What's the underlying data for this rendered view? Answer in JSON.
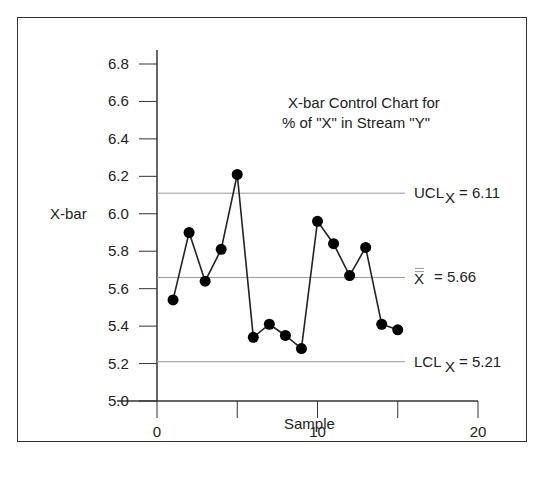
{
  "chart_data": {
    "type": "line",
    "title": "X-bar Control Chart for % of \"X\" in Stream \"Y\"",
    "title_lines": [
      "X-bar Control Chart for",
      "% of \"X\" in Stream \"Y\""
    ],
    "xlabel": "Sample",
    "ylabel": "X-bar",
    "xlim": [
      0,
      20
    ],
    "ylim": [
      5.0,
      6.8
    ],
    "x_ticks": [
      0,
      5,
      10,
      15,
      20
    ],
    "x_tick_labels": [
      "0",
      "",
      "10",
      "",
      "20"
    ],
    "y_ticks": [
      5.0,
      5.2,
      5.4,
      5.6,
      5.8,
      6.0,
      6.2,
      6.4,
      6.6,
      6.8
    ],
    "y_tick_labels": [
      "5.0",
      "5.2",
      "5.4",
      "5.6",
      "5.8",
      "6.0",
      "6.2",
      "6.4",
      "6.6",
      "6.8"
    ],
    "grid": false,
    "series": [
      {
        "name": "X-bar",
        "x": [
          1,
          2,
          3,
          4,
          5,
          6,
          7,
          8,
          9,
          10,
          11,
          12,
          13,
          14,
          15
        ],
        "values": [
          5.54,
          5.9,
          5.64,
          5.81,
          6.21,
          5.34,
          5.41,
          5.35,
          5.28,
          5.96,
          5.84,
          5.67,
          5.82,
          5.41,
          5.38
        ]
      }
    ],
    "reference_lines": [
      {
        "name": "UCL",
        "label_main": "UCL",
        "label_sub": "X",
        "label_value": "= 6.11",
        "value": 6.11
      },
      {
        "name": "Center line",
        "label_main": "X",
        "label_sub": "",
        "label_value": "= 5.66",
        "value": 5.66
      },
      {
        "name": "LCL",
        "label_main": "LCL",
        "label_sub": "X",
        "label_value": "= 5.21",
        "value": 5.21
      }
    ],
    "legend": null
  },
  "colors": {
    "line": "#222222",
    "marker": "#000000",
    "reference": "#999999",
    "axis": "#333333"
  }
}
